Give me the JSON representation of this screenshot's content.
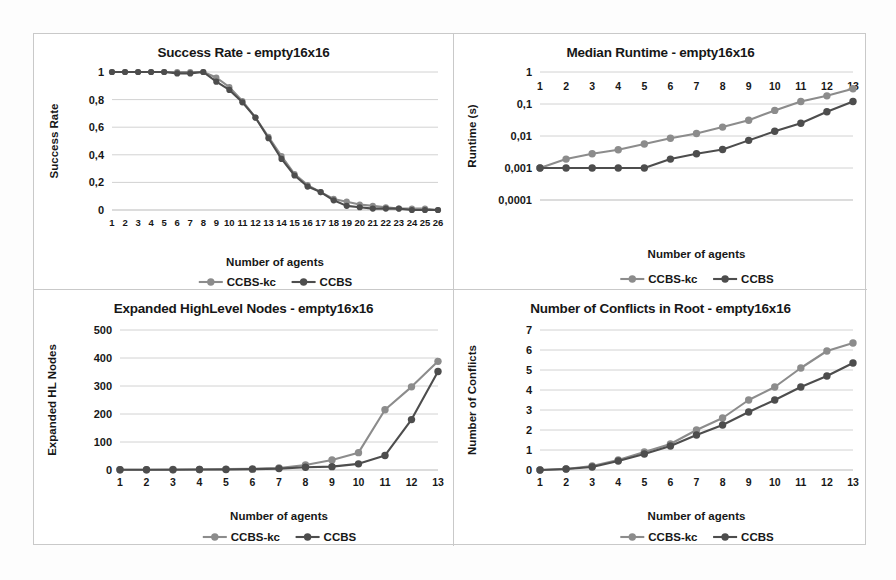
{
  "figure": {
    "background_color": "#ffffff",
    "border_color": "#c9c9c9",
    "series_colors": {
      "ccbs_kc": "#8c8c8c",
      "ccbs": "#4d4d4d"
    },
    "legend_labels": {
      "ccbs_kc": "CCBS-kc",
      "ccbs": "CCBS"
    },
    "x_axis_title": "Number of agents"
  },
  "chart_data": [
    {
      "id": "success-rate",
      "type": "line",
      "title": "Success Rate - empty16x16",
      "xlabel": "Number of agents",
      "ylabel": "Success Rate",
      "x": [
        1,
        2,
        3,
        4,
        5,
        6,
        7,
        8,
        9,
        10,
        11,
        12,
        13,
        14,
        15,
        16,
        17,
        18,
        19,
        20,
        21,
        22,
        23,
        24,
        25,
        26
      ],
      "xticklabels": [
        "1",
        "2",
        "3",
        "4",
        "5",
        "6",
        "7",
        "8",
        "9",
        "10",
        "11",
        "12",
        "13",
        "14",
        "15",
        "16",
        "17",
        "18",
        "19",
        "20",
        "21",
        "22",
        "23",
        "24",
        "25",
        "26"
      ],
      "ylim": [
        0,
        1
      ],
      "yticks": [
        0,
        0.2,
        0.4,
        0.6,
        0.8,
        1
      ],
      "yticklabels": [
        "0",
        "0,2",
        "0,4",
        "0,6",
        "0,8",
        "1"
      ],
      "grid": true,
      "legend_position": "bottom",
      "series": [
        {
          "name": "CCBS-kc",
          "color": "#8c8c8c",
          "values": [
            1,
            1,
            1,
            1,
            1,
            1,
            1,
            1,
            0.96,
            0.89,
            0.79,
            0.67,
            0.53,
            0.39,
            0.26,
            0.18,
            0.13,
            0.08,
            0.06,
            0.04,
            0.03,
            0.02,
            0.01,
            0.01,
            0.01,
            0.0
          ]
        },
        {
          "name": "CCBS",
          "color": "#4d4d4d",
          "values": [
            1,
            1,
            1,
            1,
            1,
            0.99,
            0.99,
            1,
            0.93,
            0.87,
            0.78,
            0.67,
            0.52,
            0.37,
            0.25,
            0.17,
            0.13,
            0.07,
            0.03,
            0.02,
            0.01,
            0.01,
            0.01,
            0.0,
            0.0,
            0.0
          ]
        }
      ]
    },
    {
      "id": "median-runtime",
      "type": "line",
      "title": "Median Runtime - empty16x16",
      "xlabel": "Number of agents",
      "ylabel": "Runtime (s)",
      "x": [
        1,
        2,
        3,
        4,
        5,
        6,
        7,
        8,
        9,
        10,
        11,
        12,
        13
      ],
      "xticklabels": [
        "1",
        "2",
        "3",
        "4",
        "5",
        "6",
        "7",
        "8",
        "9",
        "10",
        "11",
        "12",
        "13"
      ],
      "yscale": "log",
      "ylim": [
        0.0001,
        1
      ],
      "yticks": [
        0.0001,
        0.001,
        0.01,
        0.1,
        1
      ],
      "yticklabels": [
        "0,0001",
        "0,001",
        "0,01",
        "0,1",
        "1"
      ],
      "grid": true,
      "legend_position": "bottom",
      "series": [
        {
          "name": "CCBS-kc",
          "color": "#8c8c8c",
          "values": [
            0.001,
            0.0019,
            0.0028,
            0.0037,
            0.0056,
            0.0085,
            0.012,
            0.019,
            0.031,
            0.063,
            0.12,
            0.18,
            0.3
          ]
        },
        {
          "name": "CCBS",
          "color": "#4d4d4d",
          "values": [
            0.001,
            0.001,
            0.001,
            0.001,
            0.001,
            0.0019,
            0.0028,
            0.0038,
            0.0073,
            0.014,
            0.025,
            0.057,
            0.12
          ]
        }
      ]
    },
    {
      "id": "expanded-highlevel-nodes",
      "type": "line",
      "title": "Expanded HighLevel Nodes - empty16x16",
      "xlabel": "Number of agents",
      "ylabel": "Expanded HL  Nodes",
      "x": [
        1,
        2,
        3,
        4,
        5,
        6,
        7,
        8,
        9,
        10,
        11,
        12,
        13
      ],
      "xticklabels": [
        "1",
        "2",
        "3",
        "4",
        "5",
        "6",
        "7",
        "8",
        "9",
        "10",
        "11",
        "12",
        "13"
      ],
      "ylim": [
        0,
        500
      ],
      "yticks": [
        0,
        100,
        200,
        300,
        400,
        500
      ],
      "yticklabels": [
        "0",
        "100",
        "200",
        "300",
        "400",
        "500"
      ],
      "grid": true,
      "legend_position": "bottom",
      "series": [
        {
          "name": "CCBS-kc",
          "color": "#8c8c8c",
          "values": [
            1,
            1,
            2,
            2,
            3,
            4,
            7,
            18,
            36,
            62,
            215,
            297,
            388
          ]
        },
        {
          "name": "CCBS",
          "color": "#4d4d4d",
          "values": [
            1,
            1,
            1,
            2,
            2,
            3,
            5,
            10,
            12,
            22,
            52,
            180,
            352
          ]
        }
      ]
    },
    {
      "id": "number-of-conflicts-in-root",
      "type": "line",
      "title": "Number of Conflicts in Root - empty16x16",
      "xlabel": "Number of agents",
      "ylabel": "Number of Conflicts",
      "x": [
        1,
        2,
        3,
        4,
        5,
        6,
        7,
        8,
        9,
        10,
        11,
        12,
        13
      ],
      "xticklabels": [
        "1",
        "2",
        "3",
        "4",
        "5",
        "6",
        "7",
        "8",
        "9",
        "10",
        "11",
        "12",
        "13"
      ],
      "ylim": [
        0,
        7
      ],
      "yticks": [
        0,
        1,
        2,
        3,
        4,
        5,
        6,
        7
      ],
      "yticklabels": [
        "0",
        "1",
        "2",
        "3",
        "4",
        "5",
        "6",
        "7"
      ],
      "grid": true,
      "legend_position": "bottom",
      "series": [
        {
          "name": "CCBS-kc",
          "color": "#8c8c8c",
          "values": [
            0,
            0.05,
            0.2,
            0.5,
            0.9,
            1.3,
            2.0,
            2.6,
            3.5,
            4.15,
            5.1,
            5.95,
            6.35
          ]
        },
        {
          "name": "CCBS",
          "color": "#4d4d4d",
          "values": [
            0,
            0.05,
            0.15,
            0.45,
            0.8,
            1.2,
            1.75,
            2.25,
            2.9,
            3.5,
            4.15,
            4.7,
            5.35
          ]
        }
      ]
    }
  ]
}
